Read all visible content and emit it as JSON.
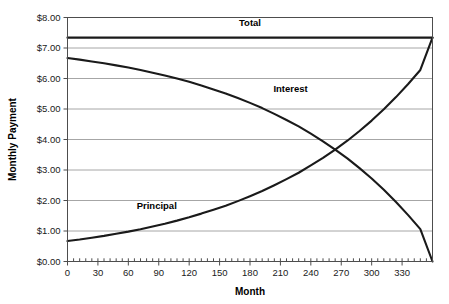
{
  "chart_data": {
    "type": "line",
    "title": "",
    "xlabel": "Month",
    "ylabel": "Monthly Payment",
    "xlim": [
      0,
      360
    ],
    "ylim": [
      0,
      8
    ],
    "grid": "horizontal",
    "legend": "inline-labels",
    "x_ticks": [
      0,
      30,
      60,
      90,
      120,
      150,
      180,
      210,
      240,
      270,
      300,
      330
    ],
    "x_tick_labels": [
      "0",
      "30",
      "60",
      "90",
      "120",
      "150",
      "180",
      "210",
      "240",
      "270",
      "300",
      "330"
    ],
    "x_minor_tick_interval": 6,
    "y_ticks": [
      0,
      1,
      2,
      3,
      4,
      5,
      6,
      7,
      8
    ],
    "y_tick_labels": [
      "$0.00",
      "$1.00",
      "$2.00",
      "$3.00",
      "$4.00",
      "$5.00",
      "$6.00",
      "$7.00",
      "$8.00"
    ],
    "x": [
      0,
      12,
      24,
      36,
      48,
      60,
      72,
      84,
      96,
      108,
      120,
      132,
      144,
      156,
      168,
      180,
      192,
      204,
      216,
      228,
      240,
      252,
      264,
      276,
      288,
      300,
      312,
      324,
      336,
      348,
      360
    ],
    "series": [
      {
        "name": "Total",
        "label": "Total",
        "color": "#1a1a1a",
        "label_x": 180,
        "label_y": 7.72,
        "values": [
          7.34,
          7.34,
          7.34,
          7.34,
          7.34,
          7.34,
          7.34,
          7.34,
          7.34,
          7.34,
          7.34,
          7.34,
          7.34,
          7.34,
          7.34,
          7.34,
          7.34,
          7.34,
          7.34,
          7.34,
          7.34,
          7.34,
          7.34,
          7.34,
          7.34,
          7.34,
          7.34,
          7.34,
          7.34,
          7.34,
          7.34
        ]
      },
      {
        "name": "Interest",
        "label": "Interest",
        "color": "#1a1a1a",
        "label_x": 220,
        "label_y": 5.55,
        "values": [
          6.67,
          6.62,
          6.56,
          6.5,
          6.43,
          6.36,
          6.28,
          6.19,
          6.1,
          6.0,
          5.89,
          5.77,
          5.64,
          5.51,
          5.36,
          5.2,
          5.03,
          4.84,
          4.64,
          4.43,
          4.19,
          3.94,
          3.67,
          3.38,
          3.06,
          2.72,
          2.35,
          1.95,
          1.52,
          1.06,
          0.0
        ]
      },
      {
        "name": "Principal",
        "label": "Principal",
        "color": "#1a1a1a",
        "label_x": 88,
        "label_y": 1.72,
        "values": [
          0.67,
          0.72,
          0.78,
          0.84,
          0.91,
          0.98,
          1.06,
          1.15,
          1.24,
          1.34,
          1.45,
          1.57,
          1.7,
          1.83,
          1.98,
          2.14,
          2.31,
          2.5,
          2.7,
          2.91,
          3.15,
          3.4,
          3.67,
          3.96,
          4.28,
          4.62,
          4.99,
          5.39,
          5.82,
          6.28,
          7.34
        ]
      }
    ]
  }
}
